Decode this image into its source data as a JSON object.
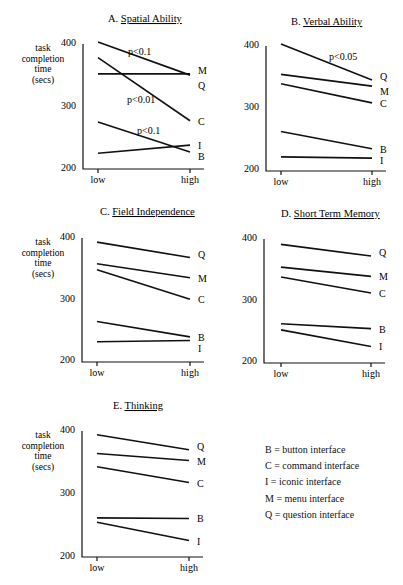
{
  "figure": {
    "y_axis_label_lines": [
      "task",
      "completion",
      "time",
      "(secs)"
    ],
    "x_tick_labels": [
      "low",
      "high"
    ],
    "y_tick_labels": [
      "400",
      "300",
      "200"
    ]
  },
  "legend": {
    "items": [
      {
        "key": "B",
        "text": "B = button interface"
      },
      {
        "key": "C",
        "text": "C = command interface"
      },
      {
        "key": "I",
        "text": "I = iconic interface"
      },
      {
        "key": "M",
        "text": "M = menu interface"
      },
      {
        "key": "Q",
        "text": "Q = question interface"
      }
    ]
  },
  "chart_data": [
    {
      "type": "line",
      "title": "A. Spatial Ability",
      "title_prefix": "A.",
      "title_text": "Spatial Ability",
      "xlabel": "",
      "ylabel": "task completion time (secs)",
      "x": [
        "low",
        "high"
      ],
      "ylim": [
        200,
        400
      ],
      "yticks": [
        200,
        300,
        400
      ],
      "grid": false,
      "series": [
        {
          "name": "Q",
          "values": [
            400,
            347
          ]
        },
        {
          "name": "M",
          "values": [
            349,
            349
          ]
        },
        {
          "name": "C",
          "values": [
            375,
            274
          ]
        },
        {
          "name": "I",
          "values": [
            222,
            235
          ]
        },
        {
          "name": "B",
          "values": [
            272,
            224
          ]
        }
      ],
      "annotations": [
        {
          "text": "p<0.1",
          "series": "Q"
        },
        {
          "text": "p<0.01",
          "series": "C"
        },
        {
          "text": "p<0.1",
          "series": "B"
        }
      ]
    },
    {
      "type": "line",
      "title": "B. Verbal Ability",
      "title_prefix": "B.",
      "title_text": "Verbal Ability",
      "xlabel": "",
      "ylabel": "",
      "x": [
        "low",
        "high"
      ],
      "ylim": [
        200,
        400
      ],
      "yticks": [
        200,
        300,
        400
      ],
      "grid": false,
      "series": [
        {
          "name": "Q",
          "values": [
            400,
            342
          ]
        },
        {
          "name": "M",
          "values": [
            351,
            332
          ]
        },
        {
          "name": "C",
          "values": [
            336,
            305
          ]
        },
        {
          "name": "B",
          "values": [
            259,
            231
          ]
        },
        {
          "name": "I",
          "values": [
            218,
            216
          ]
        }
      ],
      "annotations": [
        {
          "text": "p<0.05",
          "series": "Q"
        }
      ]
    },
    {
      "type": "line",
      "title": "C. Field Independence",
      "title_prefix": "C.",
      "title_text": "Field Independence",
      "xlabel": "",
      "ylabel": "task completion time (secs)",
      "x": [
        "low",
        "high"
      ],
      "ylim": [
        200,
        400
      ],
      "yticks": [
        200,
        300,
        400
      ],
      "grid": false,
      "series": [
        {
          "name": "Q",
          "values": [
            390,
            365
          ]
        },
        {
          "name": "M",
          "values": [
            355,
            332
          ]
        },
        {
          "name": "C",
          "values": [
            345,
            297
          ]
        },
        {
          "name": "B",
          "values": [
            261,
            236
          ]
        },
        {
          "name": "I",
          "values": [
            228,
            230
          ]
        }
      ],
      "annotations": []
    },
    {
      "type": "line",
      "title": "D. Short Term Memory",
      "title_prefix": "D.",
      "title_text": "Short Term Memory",
      "xlabel": "",
      "ylabel": "",
      "x": [
        "low",
        "high"
      ],
      "ylim": [
        200,
        400
      ],
      "yticks": [
        200,
        300,
        400
      ],
      "grid": false,
      "series": [
        {
          "name": "Q",
          "values": [
            388,
            369
          ]
        },
        {
          "name": "M",
          "values": [
            351,
            336
          ]
        },
        {
          "name": "C",
          "values": [
            335,
            309
          ]
        },
        {
          "name": "B",
          "values": [
            259,
            251
          ]
        },
        {
          "name": "I",
          "values": [
            249,
            222
          ]
        }
      ],
      "annotations": []
    },
    {
      "type": "line",
      "title": "E. Thinking",
      "title_prefix": "E.",
      "title_text": "Thinking",
      "xlabel": "",
      "ylabel": "task completion time (secs)",
      "x": [
        "low",
        "high"
      ],
      "ylim": [
        200,
        400
      ],
      "yticks": [
        200,
        300,
        400
      ],
      "grid": false,
      "series": [
        {
          "name": "Q",
          "values": [
            391,
            367
          ]
        },
        {
          "name": "M",
          "values": [
            361,
            350
          ]
        },
        {
          "name": "C",
          "values": [
            340,
            315
          ]
        },
        {
          "name": "B",
          "values": [
            259,
            258
          ]
        },
        {
          "name": "I",
          "values": [
            252,
            223
          ]
        }
      ],
      "annotations": []
    }
  ]
}
